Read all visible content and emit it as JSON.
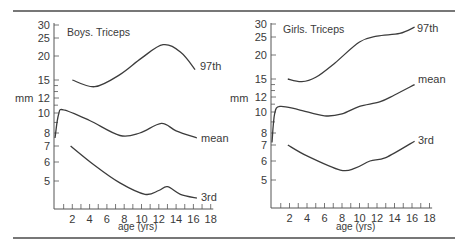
{
  "chart_data": [
    {
      "type": "line",
      "title": "Boys. Triceps",
      "xlabel": "age (yrs)",
      "ylabel": "mm",
      "x_ticks": [
        2,
        4,
        6,
        8,
        10,
        12,
        14,
        16,
        18
      ],
      "y_ticks": [
        5,
        6,
        7,
        8,
        10,
        12,
        15,
        20,
        25,
        30
      ],
      "y_scale": "log",
      "xlim": [
        0,
        18
      ],
      "ylim": [
        4,
        30
      ],
      "grid": false,
      "legend": "inline labels at curve ends",
      "series": [
        {
          "name": "97th",
          "points": [
            [
              2,
              15
            ],
            [
              4.6,
              13.8
            ],
            [
              7.5,
              16
            ],
            [
              10,
              19.5
            ],
            [
              12.5,
              23
            ],
            [
              14.5,
              21
            ],
            [
              16.2,
              17
            ]
          ]
        },
        {
          "name": "mean",
          "points": [
            [
              0,
              7.6
            ],
            [
              0.4,
              9.8
            ],
            [
              1,
              10.4
            ],
            [
              4,
              9.2
            ],
            [
              7.5,
              7.8
            ],
            [
              9.8,
              8
            ],
            [
              12.3,
              8.9
            ],
            [
              14,
              8.2
            ],
            [
              16.4,
              7.6
            ]
          ]
        },
        {
          "name": "3rd",
          "points": [
            [
              1.8,
              7
            ],
            [
              4.6,
              5.8
            ],
            [
              7.5,
              4.9
            ],
            [
              10.4,
              4.3
            ],
            [
              12,
              4.5
            ],
            [
              13,
              4.7
            ],
            [
              14.5,
              4.3
            ],
            [
              16.4,
              4.1
            ]
          ]
        }
      ]
    },
    {
      "type": "line",
      "title": "Girls. Triceps",
      "xlabel": "age (yrs)",
      "ylabel": "mm",
      "x_ticks": [
        2,
        4,
        6,
        8,
        10,
        12,
        14,
        16,
        18
      ],
      "y_ticks": [
        5,
        6,
        7,
        8,
        10,
        12,
        15,
        20,
        25,
        30
      ],
      "y_scale": "log",
      "xlim": [
        0,
        18
      ],
      "ylim": [
        4,
        30
      ],
      "grid": false,
      "legend": "inline labels at curve ends",
      "series": [
        {
          "name": "97th",
          "points": [
            [
              1.8,
              15
            ],
            [
              3.4,
              14.5
            ],
            [
              5,
              15.3
            ],
            [
              7.2,
              18.2
            ],
            [
              10,
              23.5
            ],
            [
              12,
              25.3
            ],
            [
              14.6,
              26.3
            ],
            [
              16.3,
              28.7
            ]
          ]
        },
        {
          "name": "mean",
          "points": [
            [
              0,
              7.2
            ],
            [
              0.3,
              9.8
            ],
            [
              0.9,
              10.7
            ],
            [
              3,
              10.3
            ],
            [
              6,
              9.6
            ],
            [
              8,
              9.8
            ],
            [
              10,
              10.7
            ],
            [
              12.3,
              11.3
            ],
            [
              14,
              12.3
            ],
            [
              16.3,
              14
            ]
          ]
        },
        {
          "name": "3rd",
          "points": [
            [
              1.8,
              7
            ],
            [
              4,
              6.3
            ],
            [
              7.8,
              5.5
            ],
            [
              9.5,
              5.6
            ],
            [
              11.2,
              6
            ],
            [
              13,
              6.2
            ],
            [
              16.3,
              7.3
            ]
          ]
        }
      ]
    }
  ],
  "panels": [
    {
      "title": "Boys. Triceps",
      "ylabel": "mm",
      "xlabel": "age (yrs)",
      "labels": {
        "p97": "97th",
        "mean": "mean",
        "p3": "3rd"
      }
    },
    {
      "title": "Girls. Triceps",
      "ylabel": "mm",
      "xlabel": "age (yrs)",
      "labels": {
        "p97": "97th",
        "mean": "mean",
        "p3": "3rd"
      }
    }
  ]
}
